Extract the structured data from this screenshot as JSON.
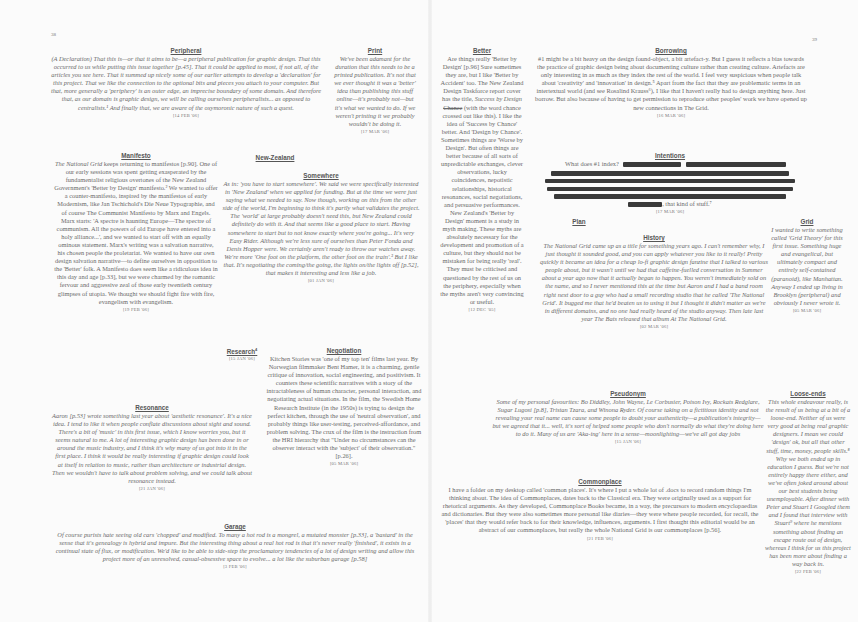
{
  "spread": {
    "left_page_number": "38",
    "right_page_number": "39"
  },
  "entries": {
    "peripheral": {
      "title": "Peripheral",
      "body": "(A Declaration) That this is—or that it aims to be—a peripheral publication for graphic design. That this occurred to us while putting this issue together [p.45]. That it could be applied to most, if not all, of the articles you see here. That it summed up nicely some of our earlier attempts to develop a 'declaration' for this project. That we like the connection to the optional bits and pieces you attach to your computer. But that, more generally a 'periphery' is an outer edge, an imprecise boundary of some domain. And therefore that, as our domain is graphic design, we will be calling ourselves peripheralists... as opposed to centralists.¹ And finally that, we are aware of the oxymoronic nature of such a quest.",
      "date": "[14 FEB '06]"
    },
    "print": {
      "title": "Print",
      "body": "We've been adamant for the duration that this needs to be a printed publication. It's not that we ever thought it was a 'better' idea than publishing this stuff online—it's probably not—but it's what we wanted to do. If we weren't printing it we probably wouldn't be doing it.",
      "date": "[17 MAR '06]"
    },
    "manifesto": {
      "title": "Manifesto",
      "body_italic_lead": "The National Grid",
      "body": " keeps returning to manifestos [p.90]. One of our early sessions was spent getting exasperated by the fundamentalist religious overtones of the New Zealand Government's 'Better by Design' manifesto.² We wanted to offer a counter-manifesto, inspired by the manifestos of early Modernism, like Jan Tschichold's Die Neue Typographie, and of course The Communist Manifesto by Marx and Engels. Marx starts: 'A spectre is haunting Europe—The spectre of communism. All the powers of old Europe have entered into a holy alliance...', and we wanted to start off with an equally ominous statement. Marx's writing was a salvation narrative, his chosen people the proletariat. We wanted to have our own design salvation narrative—to define ourselves in opposition to the 'Better' folk. A Manifesto does seem like a ridiculous idea in this day and age [p.33], but we were charmed by the romantic fervour and aggressive zeal of those early twentieth century glimpses of utopia. We thought we should fight fire with fire, evangelism with evangelism.",
      "date": "[19 FEB '06]"
    },
    "new_zealand": {
      "title": "New-Zealand"
    },
    "somewhere": {
      "title": "Somewhere",
      "body": "As in: 'you have to start somewhere'. We said we were specifically interested in 'New Zealand' when we applied for funding. But at the time we were just saying what we needed to say. Now though, working on this from the other side of the world, I'm beginning to think it's partly what validates the project. The 'world' at large probably doesn't need this, but New Zealand could definitely do with it. And that seems like a good place to start. Having somewhere to start but to not know exactly where you're going... It's very Easy Rider. Although we're less sure of ourselves than Peter Fonda and Denis Hopper were. We certainly aren't ready to throw our watches away. We're more 'One foot on the platform, the other foot on the train'.³ But I like that. It's negotiating the coming/the going, the lights on/the lights off [p.52], that makes it interesting and less like a job.",
      "date": "[01 JAN '06]"
    },
    "research": {
      "title": "Research",
      "sup": "4",
      "date": "[15 JAN '06]"
    },
    "negotiation": {
      "title": "Negotiation",
      "body": "Kitchen Stories was 'one of my top ten' films last year. By Norwegian filmmaker Bent Hamer, it is a charming, gentle critique of innovation, social engineering, and positivism. It counters these scientific narratives with a story of the intractableness of human character, personal interaction, and negotiating actual situations. In the film, the Swedish Home Research Institute (in the 1950s) is trying to design the perfect kitchen, through the use of 'neutral observation', and probably things like user-testing, perceived-affordance, and problem solving. The crux of the film is the instruction from the HRI hierarchy that \"Under no circumstances can the observer interact with the 'subject' of their observation.\" [p.26].",
      "date": "[05 MAR '06]"
    },
    "resonance": {
      "title": "Resonance",
      "body": "Aaron [p.53] wrote something last year about 'aesthetic resonance'. It's a nice idea. I tend to like it when people conflate discussions about sight and sound. There's a bit of 'music' in this first issue, which I know worries you, but it seems natural to me. A lot of interesting graphic design has been done in or around the music industry, and I think it's why many of us got into it in the first place. I think it would be really interesting if graphic design could look at itself in relation to music, rather than architecture or industrial design. Then we wouldn't have to talk about problem solving, and we could talk about resonance instead.",
      "date": "[21 JAN '06]"
    },
    "garage": {
      "title": "Garage",
      "body": "Of course purists hate seeing old cars 'chopped' and modified. To many a hot rod is a mongrel, a mutated monster [p.33], a 'bastard' in the sense that it's genealogy is hybrid and impure. But the interesting thing about a real hot rod is that it's never really 'finished', it exists in a continual state of flux, or modification. We'd like to be able to side-step the proclamatory tendencies of a lot of design writing and allow this project more of an unresolved, casual-obsessive space to evolve... a lot like the suburban garage [p.58]",
      "date": "[3 FEB '06]"
    },
    "better": {
      "title": "Better",
      "body_a": "Are things really 'Better by Design' [p.96] Sure sometimes they are, but I like 'Better by Accident' too. The New Zealand Design Taskforce report cover has the title, ",
      "body_italic": "Success by Design",
      "body_strike": "Chance",
      "body_b": " (with the word chance crossed out like this). I like the idea of 'Success by Chance' better. And 'Design by Chance'. Sometimes things are 'Worse by Design'. But often things are better because of all sorts of unpredictable exchanges, clever observations, lucky coincidences, nepotistic relationships, historical resonances, social negotiations, and persuasive performances. New Zealand's 'Better by Design' moment is a study in myth making. These myths are absolutely necessary for the development and promotion of a culture, but they should not be mistaken for being really 'real'. They must be criticised and questioned by the rest of us on the periphery, especially when the myths aren't very convincing or useful.",
      "date": "[12 DEC '05]"
    },
    "borrowing": {
      "title": "Borrowing",
      "body": "#1 might be a bit heavy on the design found-object, a bit artefact-y. But I guess it reflects a bias towards the practice of graphic design being about documenting culture rather than creating culture. Artefacts are only interesting in as much as they index the rest of the world. I feel very suspicious when people talk about 'creativity' and 'innovation' in design.⁵ Apart from the fact that they are problematic terms in an intertextual world (and see Rosalind Krauss⁶), I like that I haven't really had to design anything here. Just borrow. But also because of having to get permission to reproduce other peoples' work we have opened up new connections in The Grid.",
      "date": "[16 MAR '06]"
    },
    "intentions": {
      "title": "Intentions",
      "lead": "What does #1 index?",
      "tail": ", that kind of stuff.⁷",
      "date": "[17 MAR '06]"
    },
    "plan": {
      "title": "Plan"
    },
    "history": {
      "title": "History",
      "body": "The National Grid came up as a title for something years ago. I can't remember why, I just thought it sounded good, and you can apply whatever you like to it really! Pretty quickly it became an idea for a cheap lo-fi graphic design fanzine that I talked to various people about, but it wasn't until we had that caffeine-fuelled conversation in Summer about a year ago now that it actually began to happen. You weren't immediately sold on the name, and so I never mentioned this at the time but Aaron and I had a band room right next door to a guy who had a small recording studio that he called 'The National Grid'. It bugged me that he'd beaten us to using it but I thought it didn't matter as we're in different domains, and no one had really heard of the studio anyway. Then late last year The Bats released that album At The National Grid.",
      "date": "[02 MAR '06]"
    },
    "grid": {
      "title": "Grid",
      "body": "I wanted to write something called 'Grid Theory' for this first issue. Something huge and evangelical, but ultimately compact and entirely self-contained (paranoid), like Manhattan. Anyway I ended up living in Brooklyn (peripheral) and obviously I never wrote it.",
      "date": "[05 MAR '06]"
    },
    "pseudonym": {
      "title": "Pseudonym",
      "body": "Some of my personal favourites: Bo Diddley, John Wayne, Le Corbusier, Poison Ivy, Rockats Redglare, Sugar Lugosi [p.8], Tristan Tzara, and Winona Ryder. Of course taking on a fictitious identity and not revealing your real name can cause some people to doubt your authenticity—a publication's integrity—but we agreed that it... well, it's sort of helped some people who don't normally do what they're doing here to do it. Many of us are 'Aka-ing' here in a sense—moonlighting—we've all got day jobs",
      "date": "[15 JAN '06]"
    },
    "commonplace": {
      "title": "Commonplace",
      "body": "I have a folder on my desktop called 'common places'. It's where I put a whole lot of .docs to record random things I'm thinking about. The idea of Commonplaces, dates back to the Classical era. They were originally used as a support for rhetorical arguments. As they developed, Commonplace Books became, in a way, the precursors to modern encyclopaedias and dictionaries. But they were also sometimes more personal like diaries—they were where people recorded, for recall, the 'places' that they would refer back to for their knowledge, influences, arguments. I first thought this editorial would be an abstract of our commonplaces, but really the whole National Grid is our commonplaces [p.56].",
      "date": "[21 FEB '06]"
    },
    "loose_ends": {
      "title": "Loose-ends",
      "body": "This whole endeavour really, is the result of us being at a bit of a loose-end. Neither of us were very good at being real graphic designers. I mean we could 'design' ok, but all that other stuff, time, money, people skills.⁸ Why we both ended up in education I guess. But we're not entirely happy there either, and we've often joked around about our best students being unemployable. After dinner with Peter and Stuart I Googled them and I found that interview with Stuart⁹ where he mentions something about finding an escape route out of design, whereas I think for us this project has been more about finding a way back in.",
      "date": "[22 FEB '06]"
    }
  },
  "colors": {
    "paper": "#fbfbfb",
    "text": "#6a6a6a",
    "heading": "#555555",
    "redaction": "#3a3a3a"
  }
}
